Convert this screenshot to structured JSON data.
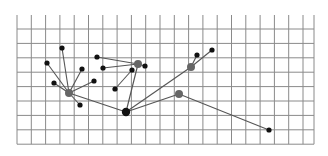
{
  "diagram": {
    "type": "graph-on-grid",
    "grid": {
      "x_lines": [
        17,
        31.3,
        45.6,
        59.9,
        74.2,
        88.5,
        102.8,
        117.1,
        131.4,
        145.7,
        160,
        174.3,
        188.6,
        202.9,
        217.2,
        231.5,
        245.8,
        260.1,
        274.4,
        288.7,
        303
      ],
      "y_lines": [
        29,
        43.4,
        57.8,
        72.2,
        86.6,
        101,
        115.4,
        129.8,
        144.2
      ],
      "top": 15,
      "bottom": 144.2,
      "left": 17,
      "right": 314,
      "color": "#8a8a8a"
    },
    "colors": {
      "edge": "#555555",
      "node_black": "#111111",
      "node_gray": "#666666"
    },
    "nodes": [
      {
        "id": "h1",
        "x": 69,
        "y": 93,
        "r": 4,
        "kind": "gray"
      },
      {
        "id": "a1",
        "x": 62,
        "y": 48,
        "r": 2.6,
        "kind": "black"
      },
      {
        "id": "a2",
        "x": 47,
        "y": 63,
        "r": 2.6,
        "kind": "black"
      },
      {
        "id": "a3",
        "x": 82,
        "y": 69,
        "r": 2.6,
        "kind": "black"
      },
      {
        "id": "a4",
        "x": 54,
        "y": 83,
        "r": 2.6,
        "kind": "black"
      },
      {
        "id": "a5",
        "x": 94,
        "y": 81,
        "r": 2.6,
        "kind": "black"
      },
      {
        "id": "a6",
        "x": 80,
        "y": 105,
        "r": 2.6,
        "kind": "black"
      },
      {
        "id": "h2",
        "x": 138,
        "y": 64,
        "r": 4,
        "kind": "gray"
      },
      {
        "id": "b1",
        "x": 97,
        "y": 57,
        "r": 2.6,
        "kind": "black"
      },
      {
        "id": "b2",
        "x": 103,
        "y": 68,
        "r": 2.6,
        "kind": "black"
      },
      {
        "id": "b3",
        "x": 145,
        "y": 66,
        "r": 2.6,
        "kind": "black"
      },
      {
        "id": "b4",
        "x": 132,
        "y": 70,
        "r": 2.6,
        "kind": "black"
      },
      {
        "id": "b5",
        "x": 115,
        "y": 89,
        "r": 2.6,
        "kind": "black"
      },
      {
        "id": "h3",
        "x": 126,
        "y": 112,
        "r": 4.2,
        "kind": "black"
      },
      {
        "id": "h4",
        "x": 191,
        "y": 67,
        "r": 4,
        "kind": "gray"
      },
      {
        "id": "c1",
        "x": 197,
        "y": 55,
        "r": 2.6,
        "kind": "black"
      },
      {
        "id": "c2",
        "x": 212,
        "y": 50,
        "r": 2.6,
        "kind": "black"
      },
      {
        "id": "h5",
        "x": 179,
        "y": 94,
        "r": 4,
        "kind": "gray"
      },
      {
        "id": "d1",
        "x": 269,
        "y": 130,
        "r": 2.6,
        "kind": "black"
      }
    ],
    "edges": [
      [
        "h1",
        "a1"
      ],
      [
        "h1",
        "a2"
      ],
      [
        "h1",
        "a3"
      ],
      [
        "h1",
        "a4"
      ],
      [
        "h1",
        "a5"
      ],
      [
        "h1",
        "a6"
      ],
      [
        "h1",
        "h3"
      ],
      [
        "h2",
        "b1"
      ],
      [
        "h2",
        "b2"
      ],
      [
        "h2",
        "b3"
      ],
      [
        "b4",
        "b5"
      ],
      [
        "h2",
        "h3"
      ],
      [
        "h3",
        "h4"
      ],
      [
        "h4",
        "c1"
      ],
      [
        "h4",
        "c2"
      ],
      [
        "h3",
        "h5"
      ],
      [
        "h5",
        "d1"
      ]
    ]
  }
}
